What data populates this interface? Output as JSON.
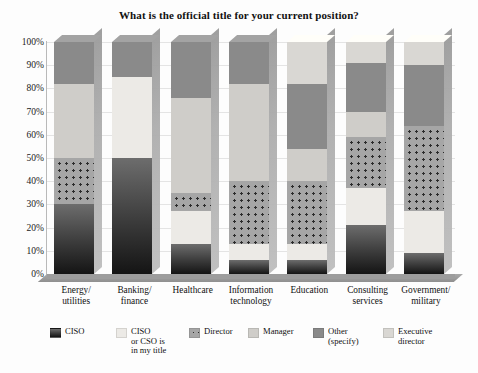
{
  "chart_data": {
    "type": "bar",
    "stacked": true,
    "title": "What is the official title for your current position?",
    "xlabel": "",
    "ylabel": "",
    "ylim": [
      0,
      100
    ],
    "grid": true,
    "legend_position": "bottom",
    "ytick_labels": [
      "100%",
      "90%",
      "80%",
      "70%",
      "60%",
      "50%",
      "40%",
      "30%",
      "20%",
      "10%",
      "0%"
    ],
    "ytick_values": [
      100,
      90,
      80,
      70,
      60,
      50,
      40,
      30,
      20,
      10,
      0
    ],
    "categories": [
      "Energy/\nutilities",
      "Banking/\nfinance",
      "Healthcare",
      "Information\ntechnology",
      "Education",
      "Consulting\nservices",
      "Government/\nmilitary"
    ],
    "series": [
      {
        "name": "CISO",
        "key": "ciso",
        "color": "#2b2b2b",
        "pattern": "solid",
        "values": [
          30,
          50,
          13,
          6,
          6,
          21,
          9
        ]
      },
      {
        "name": "CISO\nor CSO is\nin my title",
        "key": "cisotitle",
        "color": "#eceae6",
        "pattern": "solid",
        "values": [
          0,
          35,
          14,
          7,
          7,
          16,
          18
        ]
      },
      {
        "name": "Director",
        "key": "director",
        "color": "#a6a6a6",
        "pattern": "dotted",
        "values": [
          20,
          0,
          8,
          27,
          27,
          22,
          37
        ]
      },
      {
        "name": "Manager",
        "key": "manager",
        "color": "#cfcdc9",
        "pattern": "solid",
        "values": [
          32,
          0,
          41,
          42,
          14,
          11,
          0
        ]
      },
      {
        "name": "Other\n(specify)",
        "key": "other",
        "color": "#8a8a8a",
        "pattern": "solid",
        "values": [
          18,
          15,
          24,
          18,
          28,
          21,
          26
        ]
      },
      {
        "name": "Executive\ndirector",
        "key": "execdir",
        "color": "#d9d7d3",
        "pattern": "solid",
        "values": [
          0,
          0,
          0,
          0,
          18,
          9,
          10
        ]
      }
    ]
  }
}
